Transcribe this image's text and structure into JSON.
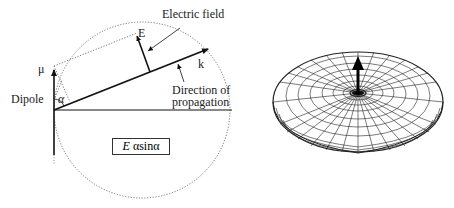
{
  "left_diagram": {
    "labels": {
      "electric_field": "Electric field",
      "e_vector": "E",
      "k_vector": "k",
      "mu": "μ",
      "dipole": "Dipole",
      "alpha": "α",
      "direction_line1": "Direction of",
      "direction_line2": "propagation"
    },
    "formula": {
      "E": "E",
      "rest": "αsinα"
    },
    "colors": {
      "line": "#111111",
      "dotted": "#555555"
    }
  },
  "right_diagram": {
    "description": "Toroidal dipole radiation pattern with dipole arrow along axis",
    "colors": {
      "mesh": "#222222",
      "arrow": "#000000"
    }
  }
}
